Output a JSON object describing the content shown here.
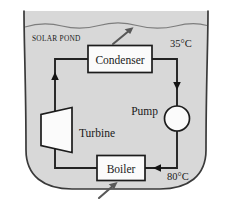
{
  "figure": {
    "pond_label": "SOLAR POND",
    "background_color": "#ffffff",
    "pond_fill_color": "#d8d8d8",
    "outline_color": "#3a3a3a",
    "pipe_color": "#222222",
    "box_fill_color": "#fbfbfb"
  },
  "components": {
    "condenser": {
      "label": "Condenser",
      "heat_arrow": "heat-rejection-arrow"
    },
    "turbine": {
      "label": "Turbine",
      "shape": "trapezoid"
    },
    "pump": {
      "label": "Pump",
      "shape": "circle"
    },
    "boiler": {
      "label": "Boiler",
      "heat_arrow": "heat-input-arrow"
    }
  },
  "temperatures": {
    "top": "35°C",
    "bottom": "80°C"
  },
  "flow": {
    "arrow_up_left_label": "vapor-to-condenser",
    "arrow_down_right_label": "condensate-to-pump",
    "arrow_up_lower_left_label": "turbine-exhaust",
    "arrow_left_lower_right_label": "feed-to-boiler"
  }
}
